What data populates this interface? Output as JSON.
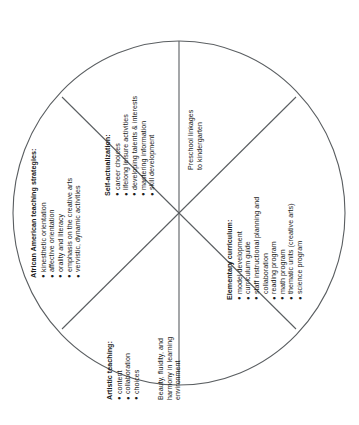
{
  "diagram": {
    "type": "circular-wheel-six-sectors",
    "shape": "circle",
    "stroke_color": "#55595c",
    "background_color": "#ffffff",
    "text_orientation": "rotated-90-counterclockwise",
    "sectors": [
      {
        "id": "african-american-teaching-strategies",
        "heading": "African American teaching strategies:",
        "items": [
          "kinesthetic orientation",
          "affective orientation",
          "orality and literacy",
          "emphasis on the creative arts",
          "vervistic, dynamic activities"
        ]
      },
      {
        "id": "self-actualization",
        "heading": "Self-actualization:",
        "items": [
          "career choices",
          "lifelong leisure activities",
          "developing talents & interests",
          "mastering information",
          "skill development"
        ]
      },
      {
        "id": "preschool-linkages",
        "heading": "",
        "lines": [
          "Preschool linkages",
          "to kindergarten"
        ]
      },
      {
        "id": "elementary-curriculum",
        "heading": "Elementary curriculum:",
        "items": [
          "model development",
          "curriculum guide",
          "staff instructional planning and",
          "collaboration",
          "reading program",
          "math program",
          "thematic units (creative arts)",
          "science program"
        ]
      },
      {
        "id": "artistic-teaching",
        "heading": "Artistic teaching:",
        "items": [
          "content",
          "collaboration",
          "choices"
        ]
      },
      {
        "id": "beauty-fluidity-harmony",
        "heading": "",
        "lines": [
          "Beauty, fluidity, and",
          "harmony in learning",
          "environment"
        ]
      }
    ],
    "bullet_glyph": "●"
  }
}
